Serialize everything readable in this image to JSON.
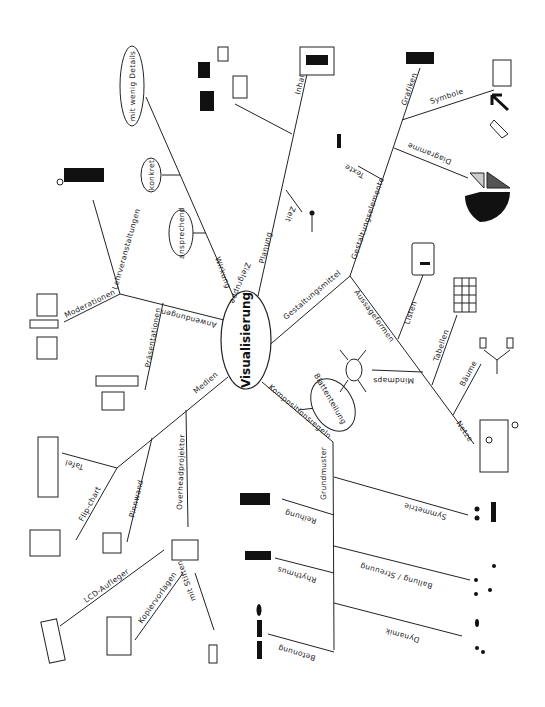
{
  "center": {
    "label": "Visualisierung"
  },
  "branches": {
    "wirkung": {
      "label": "Wirkung",
      "children": [
        "ansprechend",
        "konkret",
        "mit wenig Details"
      ]
    },
    "planung": {
      "label": "Planung",
      "children": {
        "zielgruppe": "Zielgruppe",
        "inhalt": "Inhalt",
        "zeit": "Zeit"
      }
    },
    "gestaltungsmittel": {
      "label": "Gestaltungsmittel",
      "gestaltungselemente": {
        "label": "Gestaltungselemente",
        "children": {
          "grafiken": "Grafiken",
          "symbole": "Symbole",
          "diagramme": "Diagramme",
          "texte": "Texte"
        }
      },
      "aussageformen": {
        "label": "Aussageformen",
        "children": {
          "listen": "Listen",
          "tabellen": "Tabellen",
          "mindmaps": "Mindmaps",
          "baeume": "Bäume",
          "netze": "Netze"
        }
      }
    },
    "kompositionsregeln": {
      "label": "Kompositionsregeln",
      "blattenteilung": "Blattenteilung",
      "grundmuster": {
        "label": "Grundmuster",
        "children": {
          "reihung": "Reihung",
          "symmetrie": "Symmetrie",
          "rhythmus": "Rhythmus",
          "ballung": "Ballung / Streuung",
          "betonung": "Betonung",
          "dynamik": "Dynamik"
        }
      }
    },
    "medien": {
      "label": "Medien",
      "children": {
        "tafel": "Tafel",
        "flipchart": "Flip-chart",
        "pinnwand": "Pinnwand",
        "overhead": "Overheadprojektor"
      },
      "overhead_children": {
        "lcd": "LCD-Aufleger",
        "kopier": "Kopiervorlagen",
        "stiften": "mit Stiften"
      }
    },
    "anwendungen": {
      "label": "Anwendungen",
      "children": {
        "praesentationen": "Präsentationen",
        "moderationen": "Moderationen",
        "lehr": "Lehrveranstaltungen"
      }
    }
  }
}
